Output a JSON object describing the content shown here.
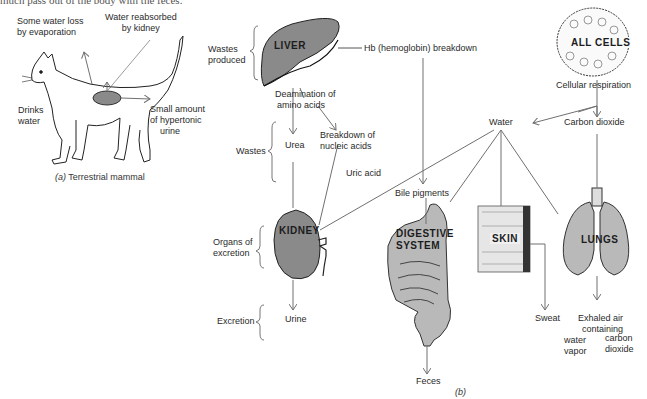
{
  "top_text": "much pass out of the body with the feces.",
  "panel_a": {
    "caption_letter": "(a)",
    "caption": "Terrestrial mammal",
    "labels": {
      "evaporation": [
        "Some water loss",
        "by evaporation"
      ],
      "reabsorbed": [
        "Water reabsorbed",
        "by kidney"
      ],
      "drinks": [
        "Drinks",
        "water"
      ],
      "urine": [
        "Small amount",
        "of hypertonic",
        "urine"
      ]
    }
  },
  "panel_b": {
    "caption": "(b)",
    "brackets": {
      "wastes_produced": [
        "Wastes",
        "produced"
      ],
      "wastes": "Wastes",
      "organs": [
        "Organs of",
        "excretion"
      ],
      "excretion": "Excretion"
    },
    "organs": {
      "liver": "LIVER",
      "kidney": "KIDNEY",
      "digestive": [
        "DIGESTIVE",
        "SYSTEM"
      ],
      "skin": "SKIN",
      "lungs": "LUNGS",
      "cells": "ALL CELLS"
    },
    "nodes": {
      "hb": "Hb (hemoglobin) breakdown",
      "deamination": [
        "Deamination of",
        "amino acids"
      ],
      "urea": "Urea",
      "nucleic": [
        "Breakdown of",
        "nucleic acids"
      ],
      "uric": "Uric acid",
      "bile": "Bile pigments",
      "cellular": "Cellular respiration",
      "water": "Water",
      "co2": "Carbon dioxide",
      "urine": "Urine",
      "feces": "Feces",
      "sweat": "Sweat",
      "exhaled": [
        "Exhaled air",
        "containing"
      ],
      "water_vapor": [
        "water",
        "vapor"
      ],
      "carbon_dioxide": [
        "carbon",
        "dioxide"
      ]
    }
  },
  "colors": {
    "organ_fill": "#8a8a8a",
    "organ_light": "#b9b9b9",
    "line": "#707070",
    "text": "#2a2a2a"
  }
}
